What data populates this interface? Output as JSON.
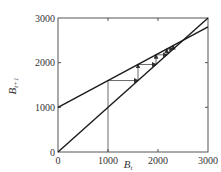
{
  "chart_data": {
    "type": "line",
    "title": "",
    "xlabel": "B_t",
    "ylabel": "B_{t+1}",
    "xlabel_main": "B",
    "xlabel_sub": "t",
    "ylabel_main": "B",
    "ylabel_sub": "t+1",
    "xlim": [
      0,
      3000
    ],
    "ylim": [
      0,
      3000
    ],
    "x_ticks": [
      0,
      1000,
      2000,
      3000
    ],
    "y_ticks": [
      0,
      1000,
      2000,
      3000
    ],
    "x_tick_labels": [
      "0",
      "1000",
      "2000",
      "3000"
    ],
    "y_tick_labels": [
      "0",
      "1000",
      "2000",
      "3000"
    ],
    "grid": false,
    "legend": null,
    "series": [
      {
        "name": "recruitment line",
        "description": "B_{t+1} = 1000 + 0.6 B_t",
        "x": [
          0,
          3000
        ],
        "y": [
          1000,
          2800
        ]
      },
      {
        "name": "replacement line (45 degree)",
        "description": "B_{t+1} = B_t",
        "x": [
          0,
          3000
        ],
        "y": [
          0,
          3000
        ]
      }
    ],
    "cobweb": {
      "start_x": 1000,
      "iterates": [
        1000,
        1600,
        1960,
        2176,
        2305.6,
        2383.4
      ],
      "equilibrium": 2500,
      "arrows": true
    }
  },
  "colors": {
    "line": "#1a1a1a",
    "frame": "#555555",
    "cobweb": "#444444"
  }
}
